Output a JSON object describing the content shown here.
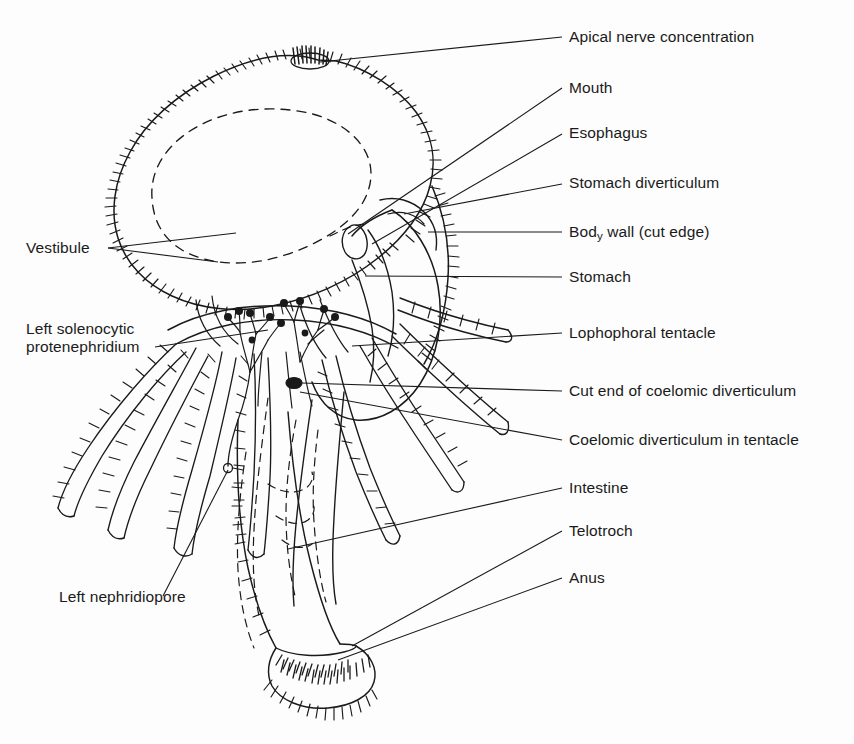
{
  "figure": {
    "background_color": "#fdfdfd",
    "ink_color": "#1a1a1a"
  },
  "labels": {
    "apical_nerve_concentration": "Apical nerve concentration",
    "mouth": "Mouth",
    "esophagus": "Esophagus",
    "stomach_diverticulum": "Stomach diverticulum",
    "body_wall_part1": "Bod",
    "body_wall_sub": "y",
    "body_wall_part2": " wall (cut edge)",
    "stomach": "Stomach",
    "lophophoral_tentacle": "Lophophoral tentacle",
    "cut_end_of_coelomic_diverticulum": "Cut end of coelomic diverticulum",
    "coelomic_diverticulum_in_tentacle": "Coelomic diverticulum in tentacle",
    "intestine": "Intestine",
    "telotroch": "Telotroch",
    "anus": "Anus",
    "vestibule": "Vestibule",
    "left_solenocytic_line1": "Left solenocytic",
    "left_solenocytic_line2": "protenephridium",
    "left_nephridiopore": "Left nephridiopore"
  }
}
